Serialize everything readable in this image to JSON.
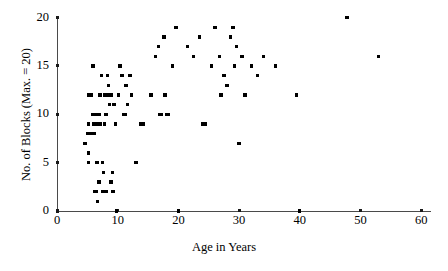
{
  "chart_data": {
    "type": "scatter",
    "title": "",
    "xlabel": "Age in Years",
    "ylabel": "No. of Blocks (Max. = 20)",
    "xlim": [
      0,
      60
    ],
    "ylim": [
      0,
      20
    ],
    "xticks": [
      0,
      10,
      20,
      30,
      40,
      50,
      60
    ],
    "xtick_labels": [
      "0",
      "10",
      "20",
      "30",
      "40",
      "50",
      "60"
    ],
    "yticks": [
      0,
      5,
      10,
      15,
      20
    ],
    "ytick_labels": [
      "0",
      "5",
      "10",
      "15",
      "20"
    ],
    "grid": false,
    "legend": null,
    "marker": "square",
    "marker_color": "#000000",
    "n_points": 96,
    "points": [
      [
        4.6,
        7.0
      ],
      [
        5.0,
        8.0
      ],
      [
        5.2,
        12.0
      ],
      [
        5.2,
        9.0
      ],
      [
        5.2,
        6.0
      ],
      [
        5.2,
        5.0
      ],
      [
        5.6,
        8.0
      ],
      [
        5.7,
        12.0
      ],
      [
        5.8,
        10.0
      ],
      [
        5.9,
        15.0
      ],
      [
        6.0,
        9.0
      ],
      [
        6.1,
        8.0
      ],
      [
        6.2,
        2.0
      ],
      [
        6.4,
        10.0
      ],
      [
        6.4,
        9.0
      ],
      [
        6.5,
        2.0
      ],
      [
        6.6,
        5.0
      ],
      [
        6.7,
        1.0
      ],
      [
        6.8,
        9.0
      ],
      [
        6.9,
        3.0
      ],
      [
        7.0,
        10.0
      ],
      [
        7.1,
        12.0
      ],
      [
        7.2,
        9.0
      ],
      [
        7.3,
        14.0
      ],
      [
        7.5,
        5.0
      ],
      [
        7.6,
        2.0
      ],
      [
        7.7,
        4.0
      ],
      [
        7.8,
        9.0
      ],
      [
        7.9,
        12.0
      ],
      [
        8.0,
        2.0
      ],
      [
        8.1,
        10.0
      ],
      [
        8.2,
        2.0
      ],
      [
        8.3,
        14.0
      ],
      [
        8.4,
        12.0
      ],
      [
        8.5,
        13.0
      ],
      [
        8.6,
        11.0
      ],
      [
        8.7,
        11.0
      ],
      [
        8.9,
        3.0
      ],
      [
        9.0,
        12.0
      ],
      [
        9.1,
        4.0
      ],
      [
        9.2,
        2.0
      ],
      [
        9.3,
        2.0
      ],
      [
        9.4,
        11.0
      ],
      [
        9.6,
        9.0
      ],
      [
        9.8,
        0.0
      ],
      [
        10.1,
        12.0
      ],
      [
        10.3,
        15.0
      ],
      [
        10.5,
        15.0
      ],
      [
        10.7,
        14.0
      ],
      [
        11.0,
        10.0
      ],
      [
        11.2,
        10.0
      ],
      [
        11.4,
        13.0
      ],
      [
        11.6,
        11.0
      ],
      [
        12.0,
        14.0
      ],
      [
        12.3,
        12.0
      ],
      [
        13.0,
        5.0
      ],
      [
        13.8,
        9.0
      ],
      [
        14.2,
        9.0
      ],
      [
        15.5,
        12.0
      ],
      [
        16.2,
        16.0
      ],
      [
        16.7,
        17.0
      ],
      [
        17.0,
        10.0
      ],
      [
        17.2,
        10.0
      ],
      [
        17.6,
        18.0
      ],
      [
        17.8,
        12.0
      ],
      [
        18.0,
        10.0
      ],
      [
        18.4,
        10.0
      ],
      [
        19.0,
        15.0
      ],
      [
        19.6,
        19.0
      ],
      [
        20.0,
        0.0
      ],
      [
        21.5,
        17.0
      ],
      [
        22.5,
        16.0
      ],
      [
        23.5,
        18.0
      ],
      [
        24.0,
        9.0
      ],
      [
        24.5,
        9.0
      ],
      [
        25.5,
        15.0
      ],
      [
        26.0,
        19.0
      ],
      [
        26.8,
        16.0
      ],
      [
        27.0,
        12.0
      ],
      [
        27.5,
        14.0
      ],
      [
        28.0,
        13.0
      ],
      [
        28.6,
        18.0
      ],
      [
        29.0,
        19.0
      ],
      [
        29.2,
        15.0
      ],
      [
        29.6,
        17.0
      ],
      [
        30.0,
        7.0
      ],
      [
        30.5,
        16.0
      ],
      [
        31.0,
        12.0
      ],
      [
        32.0,
        15.0
      ],
      [
        33.0,
        14.0
      ],
      [
        34.0,
        16.0
      ],
      [
        36.0,
        15.0
      ],
      [
        39.5,
        12.0
      ],
      [
        40.0,
        0.0
      ],
      [
        47.8,
        20.0
      ],
      [
        53.0,
        16.0
      ]
    ]
  }
}
